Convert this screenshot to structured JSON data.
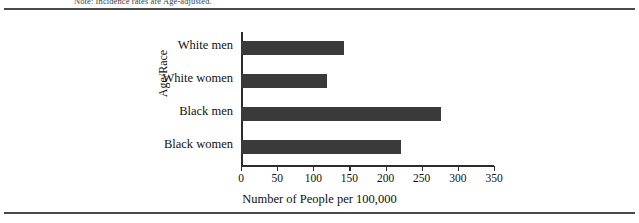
{
  "figure": {
    "note": "Note: Incidence rates are Age-adjusted."
  },
  "chart_data": {
    "type": "bar",
    "orientation": "horizontal",
    "title": "",
    "xlabel": "Number of People per 100,000",
    "ylabel": "Age/Race",
    "categories": [
      "White men",
      "White women",
      "Black men",
      "Black women"
    ],
    "values": [
      142,
      119,
      276,
      221
    ],
    "xlim": [
      0,
      350
    ],
    "xticks": [
      0,
      50,
      100,
      150,
      200,
      250,
      300,
      350
    ],
    "xtick_labels": [
      "0",
      "50",
      "100",
      "150",
      "200",
      "250",
      "300",
      "350"
    ],
    "grid": false,
    "legend": false,
    "bar_color": "#3a3a3a",
    "axis_color": "#2c2c2c",
    "background_color": "#ffffff"
  }
}
